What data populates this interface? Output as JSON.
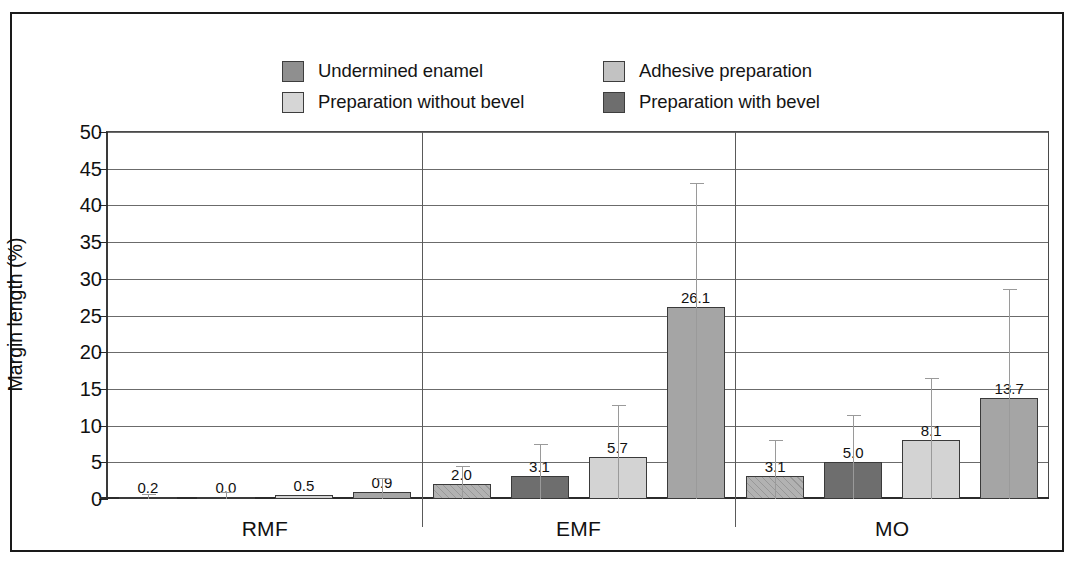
{
  "chart_data": {
    "type": "bar",
    "title": "",
    "xlabel": "",
    "ylabel": "Margin length (%)",
    "ylim": [
      0,
      50
    ],
    "ytick_step": 5,
    "yticks": [
      "50",
      "45",
      "40",
      "35",
      "30",
      "25",
      "20",
      "15",
      "10",
      "5",
      "0"
    ],
    "grid": true,
    "legend_position": "top",
    "categories": [
      "RMF",
      "EMF",
      "MO"
    ],
    "series": [
      {
        "name": "Undermined enamel",
        "color": "#b2b2b2",
        "values": [
          0.2,
          2.0,
          3.1
        ],
        "labels": [
          "0.2",
          "2.0",
          "3.1"
        ],
        "error_high": [
          0.7,
          4.5,
          8.0
        ]
      },
      {
        "name": "Preparation with bevel",
        "color": "#6e6e6e",
        "values": [
          0.0,
          3.1,
          5.0
        ],
        "labels": [
          "0.0",
          "3.1",
          "5.0"
        ],
        "error_high": [
          0.9,
          7.5,
          11.5
        ]
      },
      {
        "name": "Preparation without bevel",
        "color": "#d3d3d3",
        "values": [
          0.5,
          5.7,
          8.1
        ],
        "labels": [
          "0.5",
          "5.7",
          "8.1"
        ],
        "error_high": [
          0.5,
          12.8,
          16.5
        ]
      },
      {
        "name": "Adhesive preparation",
        "color": "#a5a5a5",
        "values": [
          0.9,
          26.1,
          13.7
        ],
        "labels": [
          "0.9",
          "26.1",
          "13.7"
        ],
        "error_high": [
          2.8,
          43.0,
          28.6
        ]
      }
    ],
    "legend_entries": [
      {
        "label": "Undermined enamel",
        "color": "#8f8f8f"
      },
      {
        "label": "Adhesive preparation",
        "color": "#c2c2c2"
      },
      {
        "label": "Preparation without bevel",
        "color": "#d6d6d6"
      },
      {
        "label": "Preparation with bevel",
        "color": "#6e6e6e"
      }
    ]
  }
}
